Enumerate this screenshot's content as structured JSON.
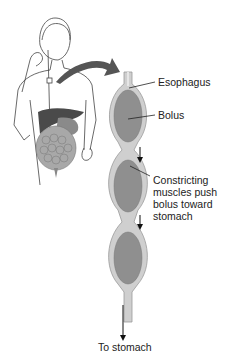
{
  "diagram": {
    "type": "anatomical-illustration",
    "labels": {
      "esophagus": "Esophagus",
      "bolus": "Bolus",
      "muscles": "Constricting\nmuscles push\nbolus toward\nstomach",
      "to_stomach": "To stomach"
    },
    "colors": {
      "esophagus_wall": "#c9c9c9",
      "esophagus_outline": "#9a9a9a",
      "bolus": "#8f8f8f",
      "arrow": "#5a5a5a",
      "organs": "#7a7a7a",
      "text": "#222222"
    },
    "elements": [
      "person-figure",
      "digestive-organs",
      "curved-arrow",
      "esophagus-tube",
      "bolus-1",
      "bolus-2",
      "bolus-3",
      "down-arrow-1",
      "down-arrow-2",
      "down-arrow-3"
    ]
  }
}
